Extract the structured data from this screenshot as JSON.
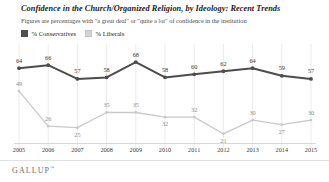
{
  "header": {
    "title": "Confidence in the Church/Organized Religion, by Ideology: Recent Trends",
    "subtitle": "Figures are percentages with \"a great deal\" or \"quite a lot\" of confidence in the institution"
  },
  "legend": {
    "items": [
      {
        "label": "% Conservatives",
        "color": "#4d4d4d"
      },
      {
        "label": "% Liberals",
        "color": "#d4d4d4"
      }
    ]
  },
  "brand": {
    "name": "GALLUP",
    "tm": "™"
  },
  "colors": {
    "conservative": "#4d4d4d",
    "liberal": "#c9c9c9",
    "gridline": "#e6e6e6",
    "label": "#333333",
    "label_light": "#8c8c8c"
  },
  "chart_data": {
    "type": "line",
    "title": "Confidence in the Church/Organized Religion, by Ideology: Recent Trends",
    "subtitle": "Figures are percentages with \"a great deal\" or \"quite a lot\" of confidence in the institution",
    "xlabel": "",
    "ylabel": "",
    "ylim": [
      15,
      72
    ],
    "grid": "vertical",
    "legend_position": "top-left",
    "categories": [
      "2005",
      "2006",
      "2007",
      "2008",
      "2009",
      "2010",
      "2011",
      "2012",
      "2013",
      "2014",
      "2015"
    ],
    "series": [
      {
        "name": "% Conservatives",
        "color": "#4d4d4d",
        "values": [
          64,
          66,
          57,
          58,
          68,
          58,
          60,
          62,
          64,
          59,
          57
        ]
      },
      {
        "name": "% Liberals",
        "color": "#c9c9c9",
        "values": [
          49,
          26,
          25,
          35,
          35,
          32,
          32,
          21,
          30,
          27,
          30
        ]
      }
    ]
  }
}
